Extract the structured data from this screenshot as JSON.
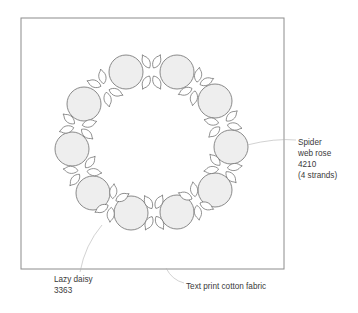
{
  "diagram": {
    "colors": {
      "frame": "#8c8c8c",
      "outline": "#6e6e6e",
      "rose_fill": "#eeeeee",
      "leader": "#b4b4b4",
      "text": "#3a3a3a"
    },
    "frame": {
      "x": 21,
      "y": 18,
      "width": 263,
      "height": 251
    },
    "roses": [
      {
        "cx": 126,
        "cy": 72,
        "r": 17
      },
      {
        "cx": 177,
        "cy": 72,
        "r": 17
      },
      {
        "cx": 215,
        "cy": 101,
        "r": 17
      },
      {
        "cx": 231,
        "cy": 147,
        "r": 17
      },
      {
        "cx": 215,
        "cy": 190,
        "r": 17
      },
      {
        "cx": 177,
        "cy": 212,
        "r": 17
      },
      {
        "cx": 131,
        "cy": 213,
        "r": 17
      },
      {
        "cx": 93,
        "cy": 193,
        "r": 17
      },
      {
        "cx": 72,
        "cy": 149,
        "r": 17
      },
      {
        "cx": 84,
        "cy": 104,
        "r": 17
      }
    ],
    "ring_center": {
      "cx": 152,
      "cy": 143
    }
  },
  "labels": {
    "rose": {
      "line1": "Spider",
      "line2": "web rose",
      "line3": "4210",
      "line4": "(4 strands)"
    },
    "daisy": {
      "line1": "Lazy daisy",
      "line2": "3363"
    },
    "fabric": {
      "line1": "Text print cotton fabric"
    }
  }
}
